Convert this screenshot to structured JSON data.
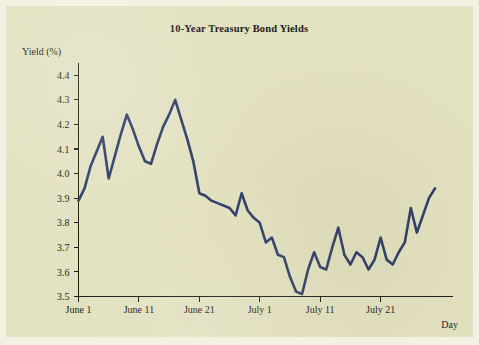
{
  "figure": {
    "background_color": "#e2e1c0",
    "page_background_color": "#f2f1e2",
    "title": "10-Year Treasury Bond Yields"
  },
  "chart_data": {
    "type": "line",
    "title": "10-Year Treasury Bond Yields",
    "xlabel": "Day",
    "ylabel": "Yield (%)",
    "ylim": [
      3.5,
      4.45
    ],
    "xlim": [
      1,
      53
    ],
    "grid": false,
    "legend": null,
    "line_color": "#2a3a68",
    "y_ticks": [
      "3.5",
      "3.6",
      "3.7",
      "3.8",
      "3.9",
      "4.0",
      "4.1",
      "4.2",
      "4.3",
      "4.4"
    ],
    "y_tick_values": [
      3.5,
      3.6,
      3.7,
      3.8,
      3.9,
      4.0,
      4.1,
      4.2,
      4.3,
      4.4
    ],
    "x_ticks": [
      "June 1",
      "June 11",
      "June 21",
      "July 1",
      "July 11",
      "July 21"
    ],
    "x_tick_values": [
      1,
      11,
      21,
      31,
      41,
      51
    ],
    "series": [
      {
        "name": "10-Year Treasury Bond Yield",
        "x": [
          1,
          2,
          3,
          4,
          5,
          6,
          7,
          8,
          9,
          10,
          11,
          12,
          13,
          14,
          15,
          16,
          17,
          18,
          19,
          20,
          21,
          22,
          23,
          24,
          25,
          26,
          27,
          28,
          29,
          30,
          31,
          32,
          33,
          34,
          35,
          36,
          37,
          38,
          39,
          40,
          41,
          42,
          43,
          44,
          45,
          46,
          47,
          48,
          49,
          50,
          51,
          52,
          53
        ],
        "values": [
          3.89,
          3.94,
          4.03,
          4.09,
          4.15,
          3.98,
          4.07,
          4.16,
          4.24,
          4.18,
          4.11,
          4.05,
          4.04,
          4.12,
          4.19,
          4.24,
          4.3,
          4.22,
          4.14,
          4.05,
          3.92,
          3.91,
          3.89,
          3.88,
          3.87,
          3.86,
          3.83,
          3.92,
          3.85,
          3.82,
          3.8,
          3.72,
          3.74,
          3.67,
          3.66,
          3.58,
          3.52,
          3.51,
          3.61,
          3.68,
          3.62,
          3.61,
          3.7,
          3.78,
          3.67,
          3.63,
          3.68,
          3.66,
          3.61,
          3.65,
          3.74,
          3.65,
          3.63
        ],
        "annotations": [
          {
            "label": "maximum",
            "x": 17,
            "value": 4.3
          },
          {
            "label": "minimum",
            "x": 38,
            "value": 3.51
          }
        ]
      }
    ],
    "tail_x": [
      53,
      54,
      55,
      56,
      57,
      58,
      59,
      60
    ],
    "tail_values": [
      3.63,
      3.68,
      3.72,
      3.86,
      3.76,
      3.83,
      3.9,
      3.94
    ]
  },
  "axis_labels": {
    "y_axis_title": "Yield (%)",
    "x_axis_title": "Day"
  }
}
